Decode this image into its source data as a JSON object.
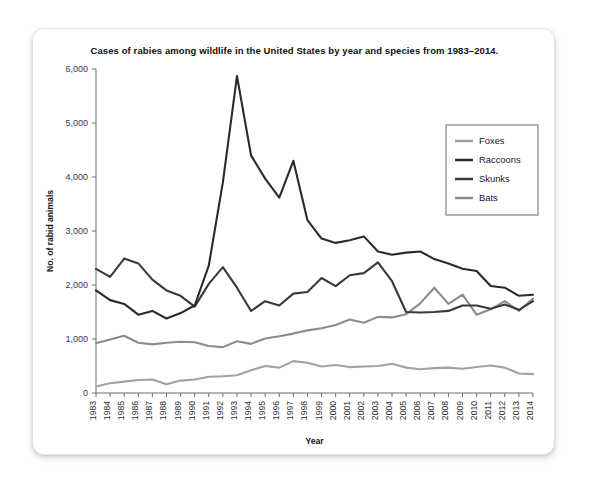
{
  "card": {
    "title": "Cases of rabies among wildlife in the United States by year and species from 1983–2014."
  },
  "chart_data": {
    "type": "line",
    "title": "Cases of rabies among wildlife in the United States by year and species from 1983–2014.",
    "xlabel": "Year",
    "ylabel": "No. of rabid animals",
    "ylim": [
      0,
      6000
    ],
    "yticks": [
      0,
      1000,
      2000,
      3000,
      4000,
      5000,
      6000
    ],
    "ytick_labels": [
      "0",
      "1,000",
      "2,000",
      "3,000",
      "4,000",
      "5,000",
      "6,000"
    ],
    "grid": false,
    "legend_position": "upper right",
    "categories": [
      "1983",
      "1984",
      "1985",
      "1986",
      "1987",
      "1988",
      "1989",
      "1990",
      "1991",
      "1992",
      "1993",
      "1994",
      "1995",
      "1996",
      "1997",
      "1998",
      "1999",
      "2000",
      "2001",
      "2002",
      "2003",
      "2004",
      "2005",
      "2006",
      "2007",
      "2008",
      "2009",
      "2010",
      "2011",
      "2012",
      "2013",
      "2014"
    ],
    "series": [
      {
        "name": "Foxes",
        "color": "#a2a2a2",
        "values": [
          120,
          180,
          210,
          240,
          250,
          160,
          230,
          250,
          300,
          310,
          330,
          420,
          500,
          470,
          590,
          560,
          490,
          520,
          480,
          490,
          500,
          540,
          470,
          440,
          460,
          470,
          450,
          480,
          510,
          470,
          360,
          350
        ]
      },
      {
        "name": "Raccoons",
        "color": "#2b2b2b",
        "values": [
          1900,
          1720,
          1650,
          1450,
          1520,
          1380,
          1480,
          1620,
          2360,
          3900,
          5870,
          4400,
          3970,
          3620,
          4300,
          3200,
          2860,
          2780,
          2830,
          2900,
          2620,
          2560,
          2600,
          2620,
          2480,
          2400,
          2300,
          2260,
          1980,
          1950,
          1800,
          1820
        ]
      },
      {
        "name": "Skunks",
        "color": "#3a3a3a",
        "values": [
          2300,
          2150,
          2490,
          2400,
          2100,
          1900,
          1800,
          1600,
          2020,
          2330,
          1950,
          1520,
          1700,
          1620,
          1840,
          1870,
          2130,
          1980,
          2180,
          2220,
          2420,
          2070,
          1500,
          1490,
          1500,
          1520,
          1620,
          1620,
          1560,
          1640,
          1540,
          1700
        ]
      },
      {
        "name": "Bats",
        "color": "#8c8c8c",
        "values": [
          920,
          990,
          1060,
          930,
          900,
          930,
          950,
          940,
          870,
          850,
          960,
          910,
          1010,
          1050,
          1100,
          1160,
          1200,
          1260,
          1360,
          1300,
          1410,
          1400,
          1460,
          1660,
          1950,
          1650,
          1820,
          1450,
          1550,
          1700,
          1520,
          1750
        ]
      }
    ]
  },
  "legend": {
    "items": [
      {
        "label": "Foxes"
      },
      {
        "label": "Raccoons"
      },
      {
        "label": "Skunks"
      },
      {
        "label": "Bats"
      }
    ]
  }
}
